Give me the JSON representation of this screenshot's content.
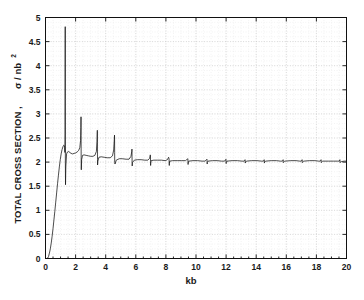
{
  "chart_data": {
    "type": "line",
    "title": "",
    "subtitle": "",
    "xlabel": "kb",
    "ylabel": "TOTAL CROSS SECTION , σ / nb",
    "ylabel_exponent": "2",
    "ylabel_main": "TOTAL  CROSS  SECTION ,",
    "ylabel_symbol": "σ / nb",
    "xlim": [
      0,
      20
    ],
    "ylim": [
      0,
      5
    ],
    "grid": true,
    "grid_style": "dotted",
    "legend": null,
    "legend_position": "none",
    "xticks": [
      0,
      2,
      4,
      6,
      8,
      10,
      12,
      14,
      16,
      18,
      20
    ],
    "xtick_labels": [
      "0",
      "2",
      "4",
      "6",
      "8",
      "10",
      "12",
      "14",
      "16",
      "18",
      "20"
    ],
    "xminor_step": 0.5,
    "yticks": [
      0,
      0.5,
      1,
      1.5,
      2,
      2.5,
      3,
      3.5,
      4,
      4.5,
      5
    ],
    "ytick_labels": [
      "0",
      "0.5",
      "1",
      "1.5",
      "2",
      "2.5",
      "3",
      "3.5",
      "4",
      "4.5",
      "5"
    ],
    "yminor_step": 0.1,
    "series": [
      {
        "name": "total cross section",
        "color": "#111111",
        "description": "Threshold rise from zero near kb=0.15 to a plateau near 2.0, with a decreasing series of sharp resonance spikes (Wigner cusps) at successive channel thresholds.",
        "x": [
          0.0,
          0.1,
          0.15,
          0.2,
          0.26,
          0.32,
          0.38,
          0.44,
          0.5,
          0.56,
          0.62,
          0.68,
          0.74,
          0.8,
          0.86,
          0.92,
          0.98,
          1.04,
          1.1,
          1.16,
          1.21,
          1.25,
          1.27,
          1.29,
          1.3,
          1.305,
          1.31,
          1.315,
          1.32,
          1.33,
          1.35,
          1.4,
          1.46,
          1.54,
          1.62,
          1.7,
          1.8,
          1.9,
          2.0,
          2.1,
          2.2,
          2.28,
          2.33,
          2.35,
          2.36,
          2.365,
          2.37,
          2.375,
          2.38,
          2.4,
          2.46,
          2.56,
          2.7,
          2.85,
          3.0,
          3.15,
          3.28,
          3.38,
          3.42,
          3.44,
          3.445,
          3.45,
          3.455,
          3.46,
          3.48,
          3.55,
          3.7,
          3.9,
          4.1,
          4.3,
          4.45,
          4.53,
          4.57,
          4.585,
          4.59,
          4.595,
          4.6,
          4.62,
          4.7,
          4.9,
          5.1,
          5.35,
          5.55,
          5.68,
          5.73,
          5.745,
          5.75,
          5.755,
          5.76,
          5.78,
          5.9,
          6.1,
          6.35,
          6.6,
          6.8,
          6.92,
          6.96,
          6.975,
          6.98,
          6.985,
          6.99,
          7.02,
          7.2,
          7.45,
          7.7,
          7.95,
          8.1,
          8.18,
          8.21,
          8.22,
          8.225,
          8.23,
          8.26,
          8.45,
          8.75,
          9.05,
          9.3,
          9.42,
          9.46,
          9.47,
          9.475,
          9.48,
          9.52,
          9.8,
          10.1,
          10.4,
          10.6,
          10.7,
          10.73,
          10.74,
          10.745,
          10.75,
          10.8,
          11.1,
          11.4,
          11.7,
          11.9,
          11.97,
          11.99,
          12.0,
          12.005,
          12.01,
          12.06,
          12.4,
          12.75,
          13.05,
          13.2,
          13.25,
          13.26,
          13.27,
          13.275,
          13.29,
          13.35,
          13.7,
          14.05,
          14.35,
          14.48,
          14.52,
          14.53,
          14.54,
          14.545,
          14.56,
          14.62,
          15.0,
          15.35,
          15.6,
          15.74,
          15.78,
          15.79,
          15.8,
          15.805,
          15.82,
          15.9,
          16.3,
          16.65,
          16.9,
          17.0,
          17.04,
          17.05,
          17.06,
          17.065,
          17.08,
          17.16,
          17.55,
          17.9,
          18.15,
          18.26,
          18.3,
          18.31,
          18.32,
          18.325,
          18.34,
          18.42,
          18.8,
          19.15,
          19.4,
          19.52,
          19.55,
          19.56,
          19.57,
          19.575,
          19.59,
          19.66,
          19.85,
          20.0
        ],
        "y": [
          0.0,
          0.0,
          0.01,
          0.04,
          0.11,
          0.2,
          0.32,
          0.46,
          0.62,
          0.8,
          0.98,
          1.17,
          1.36,
          1.55,
          1.73,
          1.9,
          2.05,
          2.17,
          2.26,
          2.32,
          2.35,
          2.34,
          2.3,
          2.2,
          2.6,
          3.6,
          4.81,
          3.3,
          2.0,
          1.53,
          1.9,
          2.17,
          2.21,
          2.22,
          2.2,
          2.18,
          2.17,
          2.18,
          2.19,
          2.21,
          2.24,
          2.3,
          2.45,
          2.72,
          2.94,
          2.55,
          2.1,
          1.86,
          1.84,
          2.05,
          2.14,
          2.15,
          2.14,
          2.13,
          2.12,
          2.12,
          2.14,
          2.22,
          2.42,
          2.63,
          2.66,
          2.4,
          2.05,
          1.94,
          2.02,
          2.1,
          2.11,
          2.1,
          2.09,
          2.09,
          2.13,
          2.25,
          2.46,
          2.56,
          2.46,
          2.2,
          1.99,
          1.96,
          2.04,
          2.07,
          2.07,
          2.06,
          2.06,
          2.12,
          2.22,
          2.27,
          2.12,
          1.97,
          1.92,
          1.99,
          2.04,
          2.05,
          2.05,
          2.04,
          2.04,
          2.08,
          2.15,
          2.13,
          2.01,
          1.93,
          1.97,
          2.03,
          2.04,
          2.04,
          2.04,
          2.03,
          2.05,
          2.1,
          2.07,
          1.97,
          1.93,
          1.98,
          2.02,
          2.03,
          2.03,
          2.03,
          2.03,
          2.06,
          2.07,
          1.98,
          1.95,
          1.98,
          2.02,
          2.03,
          2.03,
          2.02,
          2.02,
          2.05,
          2.06,
          1.99,
          1.96,
          1.99,
          2.02,
          2.03,
          2.03,
          2.02,
          2.02,
          2.05,
          2.06,
          2.0,
          1.97,
          1.99,
          2.02,
          2.03,
          2.03,
          2.02,
          2.02,
          2.04,
          2.05,
          2.0,
          1.98,
          2.0,
          2.02,
          2.03,
          2.03,
          2.02,
          2.02,
          2.04,
          2.05,
          2.0,
          1.98,
          2.0,
          2.02,
          2.03,
          2.03,
          2.02,
          2.02,
          2.04,
          2.05,
          2.01,
          1.99,
          2.0,
          2.02,
          2.03,
          2.03,
          2.02,
          2.02,
          2.04,
          2.05,
          2.01,
          1.99,
          2.0,
          2.02,
          2.03,
          2.03,
          2.02,
          2.02,
          2.04,
          2.05,
          2.01,
          1.99,
          2.0,
          2.02,
          2.02,
          2.02,
          2.02,
          2.02,
          2.04,
          2.05,
          2.01,
          1.99,
          2.0,
          2.01,
          2.02,
          2.02
        ]
      }
    ],
    "annotations": [],
    "resonance_peaks": [
      {
        "kb": 1.31,
        "peak": 4.81,
        "dip": 1.53
      },
      {
        "kb": 2.36,
        "peak": 2.94,
        "dip": 1.84
      },
      {
        "kb": 3.445,
        "peak": 2.66,
        "dip": 1.94
      },
      {
        "kb": 4.59,
        "peak": 2.56,
        "dip": 1.96
      },
      {
        "kb": 5.75,
        "peak": 2.27,
        "dip": 1.92
      },
      {
        "kb": 6.98,
        "peak": 2.15,
        "dip": 1.93
      },
      {
        "kb": 8.22,
        "peak": 2.1,
        "dip": 1.93
      },
      {
        "kb": 9.47,
        "peak": 2.07,
        "dip": 1.95
      },
      {
        "kb": 10.74,
        "peak": 2.06,
        "dip": 1.96
      },
      {
        "kb": 12.0,
        "peak": 2.06,
        "dip": 1.97
      },
      {
        "kb": 13.27,
        "peak": 2.05,
        "dip": 1.98
      },
      {
        "kb": 14.54,
        "peak": 2.05,
        "dip": 1.98
      },
      {
        "kb": 15.8,
        "peak": 2.05,
        "dip": 1.99
      },
      {
        "kb": 17.06,
        "peak": 2.05,
        "dip": 1.99
      },
      {
        "kb": 18.32,
        "peak": 2.05,
        "dip": 1.99
      },
      {
        "kb": 19.57,
        "peak": 2.05,
        "dip": 1.99
      }
    ]
  },
  "figure": {
    "background_color": "#ffffff",
    "axes_color": "#111111",
    "grid_color": "#c8c8c8",
    "curve_color": "#111111"
  }
}
